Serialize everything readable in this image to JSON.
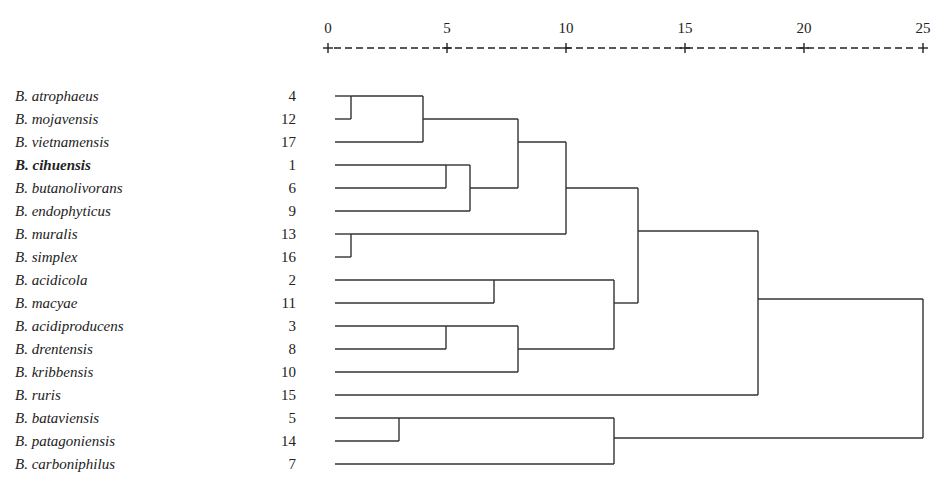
{
  "axis": {
    "ticks": [
      {
        "label": "0",
        "x": 328
      },
      {
        "label": "5",
        "x": 447
      },
      {
        "label": "10",
        "x": 566
      },
      {
        "label": "15",
        "x": 685
      },
      {
        "label": "20",
        "x": 804
      },
      {
        "label": "25",
        "x": 923
      }
    ],
    "rule_y": 48,
    "label_y": 33
  },
  "leaves": [
    {
      "name": "B. atrophaeus",
      "num": "4",
      "bold": false
    },
    {
      "name": "B. mojavensis",
      "num": "12",
      "bold": false
    },
    {
      "name": "B. vietnamensis",
      "num": "17",
      "bold": false
    },
    {
      "name": "B. cihuensis",
      "num": "1",
      "bold": true
    },
    {
      "name": "B. butanolivorans",
      "num": "6",
      "bold": false
    },
    {
      "name": "B. endophyticus",
      "num": "9",
      "bold": false
    },
    {
      "name": "B. muralis",
      "num": "13",
      "bold": false
    },
    {
      "name": "B. simplex",
      "num": "16",
      "bold": false
    },
    {
      "name": "B. acidicola",
      "num": "2",
      "bold": false
    },
    {
      "name": "B. macyae",
      "num": "11",
      "bold": false
    },
    {
      "name": "B. acidiproducens",
      "num": "3",
      "bold": false
    },
    {
      "name": "B. drentensis",
      "num": "8",
      "bold": false
    },
    {
      "name": "B. kribbensis",
      "num": "10",
      "bold": false
    },
    {
      "name": "B. ruris",
      "num": "15",
      "bold": false
    },
    {
      "name": "B. bataviensis",
      "num": "5",
      "bold": false
    },
    {
      "name": "B. patagoniensis",
      "num": "14",
      "bold": false
    },
    {
      "name": "B. carboniphilus",
      "num": "7",
      "bold": false
    }
  ],
  "layout": {
    "first_row_y": 96,
    "row_pitch": 23,
    "name_x": 15,
    "num_right_x": 296,
    "leaf_start_x": 335
  },
  "merges": [
    {
      "id": "m1",
      "x": 351,
      "top": 96,
      "bottom": 119,
      "from_top_x": 335,
      "from_bottom_x": 335,
      "out_y": 107
    },
    {
      "id": "m2",
      "x": 423,
      "top": 96,
      "bottom": 142,
      "from_top_x": 351,
      "from_bottom_x": 335,
      "out_y": 119,
      "top_from_y": 96
    },
    {
      "id": "m3",
      "x": 446,
      "top": 165,
      "bottom": 188,
      "from_top_x": 335,
      "from_bottom_x": 335,
      "out_y": 188
    },
    {
      "id": "m4",
      "x": 470,
      "top": 165,
      "bottom": 211,
      "from_top_x": 446,
      "from_bottom_x": 335,
      "out_y": 188
    },
    {
      "id": "m5",
      "x": 518,
      "top": 119,
      "bottom": 188,
      "from_top_x": 423,
      "from_bottom_x": 470,
      "out_y": 142
    },
    {
      "id": "m6",
      "x": 351,
      "top": 234,
      "bottom": 257,
      "from_top_x": 335,
      "from_bottom_x": 335,
      "out_y": 234
    },
    {
      "id": "m7",
      "x": 566,
      "top": 142,
      "bottom": 234,
      "from_top_x": 518,
      "from_bottom_x": 351,
      "out_y": 188
    },
    {
      "id": "m8",
      "x": 494,
      "top": 280,
      "bottom": 303,
      "from_top_x": 335,
      "from_bottom_x": 335,
      "out_y": 280
    },
    {
      "id": "m9",
      "x": 446,
      "top": 326,
      "bottom": 349,
      "from_top_x": 335,
      "from_bottom_x": 335,
      "out_y": 349
    },
    {
      "id": "m10",
      "x": 518,
      "top": 326,
      "bottom": 372,
      "from_top_x": 446,
      "from_bottom_x": 335,
      "out_y": 349
    },
    {
      "id": "m11",
      "x": 614,
      "top": 280,
      "bottom": 349,
      "from_top_x": 494,
      "from_bottom_x": 518,
      "out_y": 303
    },
    {
      "id": "m12",
      "x": 638,
      "top": 188,
      "bottom": 303,
      "from_top_x": 566,
      "from_bottom_x": 614,
      "out_y": 234
    },
    {
      "id": "m13",
      "x": 758,
      "top": 231,
      "bottom": 395,
      "from_top_x": 638,
      "from_bottom_x": 335,
      "out_y": 299
    },
    {
      "id": "m14",
      "x": 399,
      "top": 418,
      "bottom": 441,
      "from_top_x": 335,
      "from_bottom_x": 335,
      "out_y": 418
    },
    {
      "id": "m15",
      "x": 614,
      "top": 418,
      "bottom": 464,
      "from_top_x": 399,
      "from_bottom_x": 335,
      "out_y": 441
    },
    {
      "id": "m16",
      "x": 923,
      "top": 299,
      "bottom": 438,
      "from_top_x": 758,
      "from_bottom_x": 614,
      "out_y": 368
    }
  ],
  "chart_data": {
    "type": "dendrogram",
    "title": "",
    "xlabel": "Rescaled distance cluster combine",
    "x_ticks": [
      0,
      5,
      10,
      15,
      20,
      25
    ],
    "xlim": [
      0,
      25
    ],
    "leaf_order": [
      "B. atrophaeus (4)",
      "B. mojavensis (12)",
      "B. vietnamensis (17)",
      "B. cihuensis (1)",
      "B. butanolivorans (6)",
      "B. endophyticus (9)",
      "B. muralis (13)",
      "B. simplex (16)",
      "B. acidicola (2)",
      "B. macyae (11)",
      "B. acidiproducens (3)",
      "B. drentensis (8)",
      "B. kribbensis (10)",
      "B. ruris (15)",
      "B. bataviensis (5)",
      "B. patagoniensis (14)",
      "B. carboniphilus (7)"
    ],
    "highlighted_leaf": "B. cihuensis",
    "merges": [
      {
        "members": [
          "4",
          "12"
        ],
        "distance": 1.0
      },
      {
        "members": [
          "4,12",
          "17"
        ],
        "distance": 4.0
      },
      {
        "members": [
          "1",
          "6"
        ],
        "distance": 5.0
      },
      {
        "members": [
          "1,6",
          "9"
        ],
        "distance": 6.0
      },
      {
        "members": [
          "4,12,17",
          "1,6,9"
        ],
        "distance": 8.0
      },
      {
        "members": [
          "13",
          "16"
        ],
        "distance": 1.0
      },
      {
        "members": [
          "4,12,17,1,6,9",
          "13,16"
        ],
        "distance": 10.0
      },
      {
        "members": [
          "2",
          "11"
        ],
        "distance": 7.0
      },
      {
        "members": [
          "3",
          "8"
        ],
        "distance": 5.0
      },
      {
        "members": [
          "3,8",
          "10"
        ],
        "distance": 8.0
      },
      {
        "members": [
          "2,11",
          "3,8,10"
        ],
        "distance": 12.0
      },
      {
        "members": [
          "4,12,17,1,6,9,13,16",
          "2,11,3,8,10"
        ],
        "distance": 13.0
      },
      {
        "members": [
          "cluster_A",
          "15"
        ],
        "distance": 18.0
      },
      {
        "members": [
          "5",
          "14"
        ],
        "distance": 3.0
      },
      {
        "members": [
          "5,14",
          "7"
        ],
        "distance": 12.0
      },
      {
        "members": [
          "cluster_A,15",
          "5,14,7"
        ],
        "distance": 25.0
      }
    ]
  }
}
